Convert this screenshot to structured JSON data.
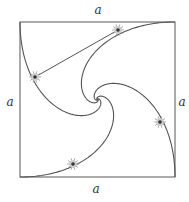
{
  "figure": {
    "square": {
      "x": 20,
      "y": 22,
      "size": 155,
      "stroke": "#666666"
    },
    "center": {
      "x": 97.5,
      "y": 99.5
    },
    "side_labels": {
      "top": "a",
      "left": "a",
      "right": "a",
      "bottom": "a"
    },
    "label_positions": {
      "top": [
        98,
        14
      ],
      "left": [
        10,
        106
      ],
      "right": [
        182,
        106
      ],
      "bottom": [
        96,
        193
      ]
    },
    "spiral": {
      "direction": -1,
      "turns_rad": 8.5,
      "stroke": "#555555"
    },
    "bugs": [
      {
        "name": "bug-top-right-path",
        "x": 118,
        "y": 30
      },
      {
        "name": "bug-top-left-path",
        "x": 35,
        "y": 77
      },
      {
        "name": "bug-bottom-left-path",
        "x": 73,
        "y": 164
      },
      {
        "name": "bug-bottom-right-path",
        "x": 160,
        "y": 122
      }
    ],
    "pursuit_line": {
      "from": [
        35,
        77
      ],
      "to": [
        118,
        30
      ]
    },
    "colors": {
      "curve": "#555555",
      "bug": "#999999",
      "bug_head": "#333333"
    }
  }
}
